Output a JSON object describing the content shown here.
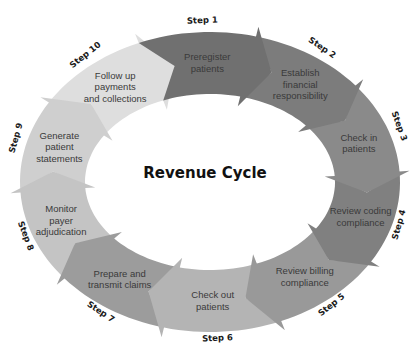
{
  "diagram": {
    "title": "Revenue Cycle",
    "steps": [
      {
        "step": "Step 1",
        "lines": [
          "Preregister",
          "patients"
        ],
        "color": "#707070"
      },
      {
        "step": "Step 2",
        "lines": [
          "Establish",
          "financial",
          "responsibility"
        ],
        "color": "#7c7c7c"
      },
      {
        "step": "Step 3",
        "lines": [
          "Check in",
          "patients"
        ],
        "color": "#8a8a8a"
      },
      {
        "step": "Step 4",
        "lines": [
          "Review coding",
          "compliance"
        ],
        "color": "#808080"
      },
      {
        "step": "Step 5",
        "lines": [
          "Review billing",
          "compliance"
        ],
        "color": "#999999"
      },
      {
        "step": "Step 6",
        "lines": [
          "Check out",
          "patients"
        ],
        "color": "#b4b4b4"
      },
      {
        "step": "Step 7",
        "lines": [
          "Prepare and",
          "transmit claims"
        ],
        "color": "#9c9c9c"
      },
      {
        "step": "Step 8",
        "lines": [
          "Monitor",
          "payer",
          "adjudication"
        ],
        "color": "#c4c4c4"
      },
      {
        "step": "Step 9",
        "lines": [
          "Generate",
          "patient",
          "statements"
        ],
        "color": "#cfcfcf"
      },
      {
        "step": "Step 10",
        "lines": [
          "Follow up",
          "payments",
          "and collections"
        ],
        "color": "#dedede"
      }
    ]
  }
}
